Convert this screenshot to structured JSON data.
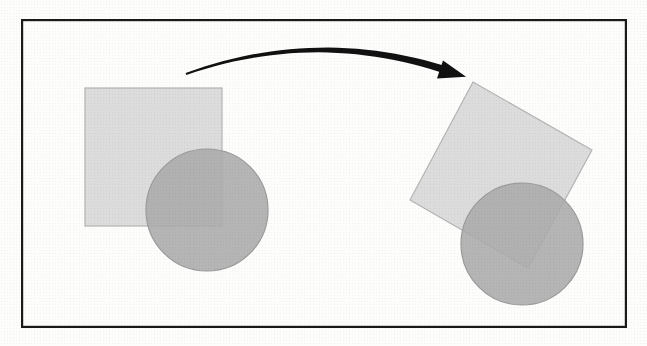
{
  "figure": {
    "caption": "",
    "background_color": "#fdfdfc",
    "frame": {
      "name": "figure-border",
      "x": 21,
      "y": 19,
      "width": 606,
      "height": 309,
      "stroke_color": "#1a1a1a",
      "stroke_width": 2.2,
      "fill": "none"
    },
    "colors": {
      "square_fill": "#d9d9d9",
      "square_stroke": "#b4b4b4",
      "circle_fill": "#ababab",
      "circle_stroke": "#9a9a9a",
      "arrow_color": "#111111",
      "paper": "#fdfdfc"
    },
    "objects": [
      {
        "id": "source-square",
        "label": "Source square",
        "shape": "square",
        "state": "before",
        "x": 85,
        "y": 88,
        "width": 137,
        "height": 138,
        "rotation_deg": 0,
        "fill": "#d9d9d9",
        "stroke": "#b4b4b4",
        "opacity": 0.92
      },
      {
        "id": "source-circle",
        "label": "Source circle",
        "shape": "circle",
        "state": "before",
        "cx": 207,
        "cy": 210,
        "r": 61,
        "fill": "#ababab",
        "stroke": "#9a9a9a",
        "opacity": 0.88
      },
      {
        "id": "target-square",
        "label": "Rotated square",
        "shape": "square",
        "state": "after",
        "cx": 501,
        "cy": 175,
        "width": 137,
        "height": 138,
        "rotation_deg": -25,
        "fill": "#d9d9d9",
        "stroke": "#b4b4b4",
        "opacity": 0.92,
        "corners": [
          {
            "name": "top",
            "x": 473,
            "y": 82
          },
          {
            "name": "right",
            "x": 592,
            "y": 150
          },
          {
            "name": "bottom",
            "x": 528,
            "y": 268
          },
          {
            "name": "left",
            "x": 410,
            "y": 200
          }
        ]
      },
      {
        "id": "target-circle",
        "label": "Rotated circle",
        "shape": "circle",
        "state": "after",
        "cx": 522,
        "cy": 244,
        "r": 61,
        "fill": "#ababab",
        "stroke": "#9a9a9a",
        "opacity": 0.88
      }
    ],
    "arrow": {
      "id": "transform-arrow",
      "label": "Transformation arrow",
      "start_x": 186,
      "start_y": 74,
      "end_x": 452,
      "end_y": 72,
      "control_x": 318,
      "control_y": 27,
      "direction": "left-to-right",
      "curvature": "arc-over",
      "stroke_color": "#111111",
      "stroke_width_start": 2.0,
      "stroke_width_end": 7.5,
      "head_length": 27,
      "head_width": 22
    }
  }
}
